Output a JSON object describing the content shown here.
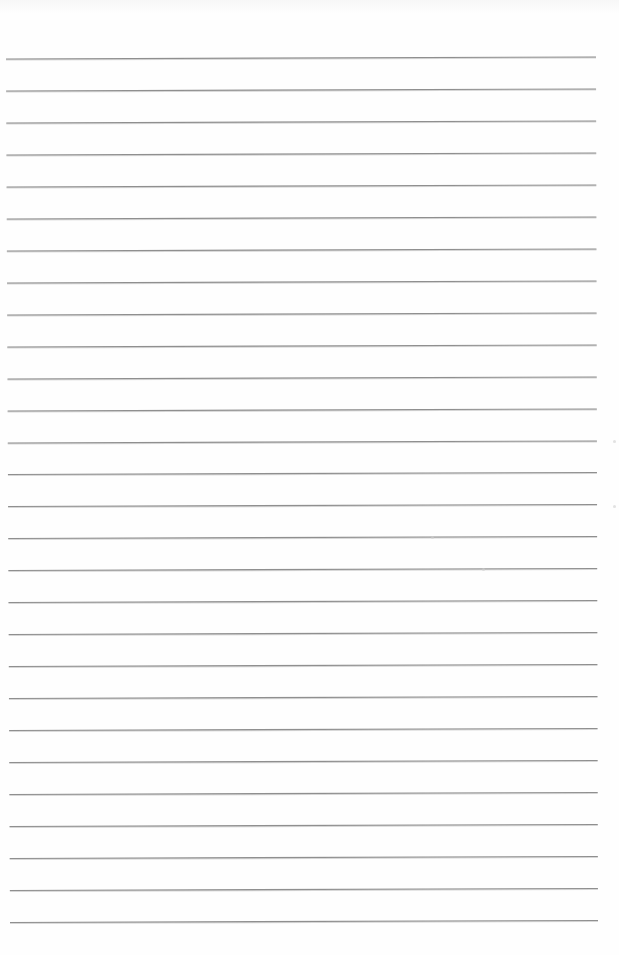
{
  "document": {
    "type": "lined-paper",
    "background_color": "#fefefe",
    "line_color": "#8f8f8f",
    "line_count": 28,
    "line_spacing_px": 32,
    "first_line_y_left": 59,
    "first_line_y_right": 57,
    "left_margin_x_start": 6,
    "left_margin_x_end": 10,
    "right_edge_x_start": 596,
    "right_edge_x_end": 598
  }
}
